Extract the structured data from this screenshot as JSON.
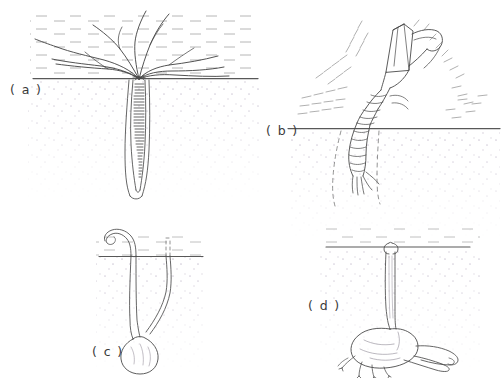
{
  "figure": {
    "background_color": "#ffffff",
    "ink_color": "#4a4a4a",
    "water_hatch_color": "#9a9a9a",
    "sediment_stipple_color": "#c9c3cf",
    "substrate_line_color": "#5a5a5a",
    "width": 502,
    "height": 378
  },
  "panels": [
    {
      "id": "a",
      "label": "( a )",
      "subject": "tentaculate-worm-in-vertical-burrow",
      "description": "Radiating flexible tentacles spread across the sediment surface from a central mouth; a banded vermiform body extends down a narrow vertical burrow.",
      "substrate_line_y": 78,
      "tentacle_count": 9,
      "body_banding": "transverse-bands",
      "burrow_type": "vertical-shaft"
    },
    {
      "id": "b",
      "label": "( b )",
      "subject": "stomatopod-mantis-shrimp-at-burrow-mouth",
      "description": "Segmented crustacean with raised raptorial appendages emerging head-up from an oblique burrow; radiating hatch strokes indicate disturbed water.",
      "substrate_line_y": 128,
      "appendages": "raptorial-claws-raised",
      "burrow_type": "oblique-shaft-dashed-outline",
      "body_segments": 8
    },
    {
      "id": "c",
      "label": "( c )",
      "subject": "u-shaped-burrow-with-terminal-chamber",
      "description": "A hooked chimney tube rises above the surface; a second flush opening is shown dashed. Both tubes converge into a rounded terminal chamber at depth.",
      "substrate_line_y": 256,
      "openings": 2,
      "chimney": "hooked-above-surface",
      "chamber": "rounded-oval",
      "burrow_type": "u-shaped"
    },
    {
      "id": "d",
      "label": "( d )",
      "subject": "shaft-and-chamber-burrow-with-lateral-tunnel",
      "description": "A single funnel-mouthed vertical shaft descends to a bulbous chamber bearing a tapering lateral tunnel and small root-like basal projections.",
      "substrate_line_y": 247,
      "openings": 1,
      "shaft": "vertical-funnel-mouth",
      "chamber": "bulbous",
      "lateral_tunnel": "tapering-rightward",
      "burrow_type": "shaft-and-chamber"
    }
  ]
}
